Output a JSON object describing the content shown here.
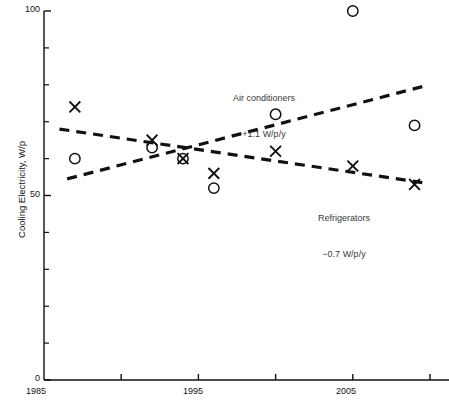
{
  "figure": {
    "name": "cooling-electricity-scatter",
    "background": "#ffffff",
    "ink_color": "#111111",
    "annotation_color": "#3a3a3a"
  },
  "axes": {
    "y": {
      "title": "Cooling Electricity, W/p",
      "labels": [
        "100",
        "50",
        "0"
      ],
      "label_values": [
        100,
        50,
        0
      ],
      "range": [
        0,
        100
      ],
      "major_ticks": [
        0,
        50,
        100
      ],
      "minor_ticks": [
        10,
        20,
        30,
        40,
        60,
        70,
        80,
        90
      ],
      "tick_interval": 10
    },
    "x": {
      "title": "",
      "labels": [
        "1985",
        "1995",
        "2005"
      ],
      "label_values": [
        1985,
        1995,
        2005
      ],
      "range": [
        1985,
        2011
      ],
      "ticks": [
        1985,
        1990,
        1995,
        2000,
        2005,
        2010
      ],
      "tick_interval": 5
    }
  },
  "annotations": [
    {
      "id": "air-conditioners",
      "line1": "Air conditioners",
      "line2": "+1.1 W/p/y"
    },
    {
      "id": "refrigerators",
      "line1": "Refrigerators",
      "line2": "−0.7 W/p/y"
    }
  ],
  "chart_data": {
    "type": "scatter",
    "title": "",
    "xlabel": "",
    "ylabel": "Cooling Electricity, W/p",
    "xlim": [
      1985,
      2011
    ],
    "ylim": [
      0,
      100
    ],
    "grid": false,
    "legend": "inline-annotations",
    "series": [
      {
        "name": "Air conditioners",
        "marker": "circle-open",
        "trend_label": "+1.1 W/p/y",
        "trend_slope": 1.1,
        "trend_units": "W/p/y",
        "trend_line": {
          "style": "dashed",
          "x": [
            1986.5,
            2009.5
          ],
          "y": [
            54.5,
            79.5
          ]
        },
        "points": [
          {
            "x": 1987,
            "y": 60
          },
          {
            "x": 1992,
            "y": 63
          },
          {
            "x": 1994,
            "y": 60
          },
          {
            "x": 1996,
            "y": 52
          },
          {
            "x": 2000,
            "y": 72
          },
          {
            "x": 2005,
            "y": 100
          },
          {
            "x": 2009,
            "y": 69
          }
        ]
      },
      {
        "name": "Refrigerators",
        "marker": "cross",
        "trend_label": "−0.7 W/p/y",
        "trend_slope": -0.7,
        "trend_units": "W/p/y",
        "trend_line": {
          "style": "dashed",
          "x": [
            1986.0,
            2009.5
          ],
          "y": [
            68.0,
            53.5
          ]
        },
        "points": [
          {
            "x": 1987,
            "y": 74
          },
          {
            "x": 1992,
            "y": 65
          },
          {
            "x": 1994,
            "y": 60
          },
          {
            "x": 1996,
            "y": 56
          },
          {
            "x": 2000,
            "y": 62
          },
          {
            "x": 2005,
            "y": 58
          },
          {
            "x": 2009,
            "y": 53
          }
        ]
      }
    ]
  }
}
